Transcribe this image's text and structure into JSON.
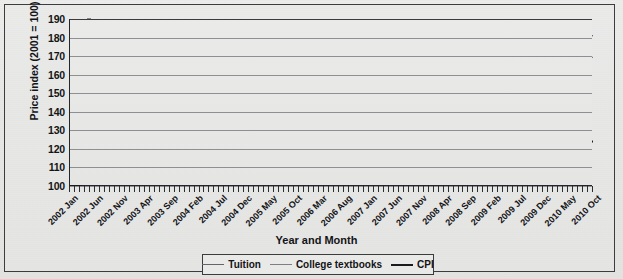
{
  "figure": {
    "background_color": "#e9e9e7",
    "frame_color": "#3b3c3e",
    "axis_color": "#25262a",
    "grid_color": "#8d8f93"
  },
  "chart_data": {
    "type": "line",
    "title": "",
    "xlabel": "Year and Month",
    "ylabel": "Price index (2001 = 100)",
    "ylim": [
      100,
      190
    ],
    "ytick_labels": [
      "100",
      "110",
      "120",
      "130",
      "140",
      "150",
      "160",
      "170",
      "180",
      "190"
    ],
    "ytick_values": [
      100,
      110,
      120,
      130,
      140,
      150,
      160,
      170,
      180,
      190
    ],
    "grid": true,
    "grid_axis": "y",
    "legend_position": "bottom",
    "x_tick_count": 106,
    "x_label_interval": 5,
    "tick_labels": [
      "2002 Jan",
      "2002 Jun",
      "2002 Nov",
      "2003 Apr",
      "2003 Sep",
      "2004 Feb",
      "2004 Jul",
      "2004 Dec",
      "2005 May",
      "2005 Oct",
      "2006 Mar",
      "2006 Aug",
      "2007 Jan",
      "2007 Jun",
      "2007 Nov",
      "2008 Apr",
      "2008 Sep",
      "2009 Feb",
      "2009 Jul",
      "2009 Dec",
      "2010 May",
      "2010 Oct"
    ],
    "x_start": "2002 Jan",
    "x_end": "2010 Oct",
    "series": [
      {
        "name": "Tuition",
        "color": "#63656a",
        "width": 1.3,
        "values": [
          100.0,
          100.5,
          101.1,
          101.6,
          102.2,
          102.7,
          103.3,
          104.5,
          105.8,
          106.4,
          107.0,
          107.5,
          108.1,
          108.7,
          109.4,
          110.0,
          110.6,
          111.3,
          111.9,
          113.6,
          115.4,
          116.1,
          116.8,
          117.5,
          118.2,
          118.9,
          119.6,
          120.3,
          121.0,
          121.7,
          122.4,
          124.4,
          126.4,
          127.2,
          128.0,
          128.8,
          129.5,
          130.3,
          131.1,
          131.9,
          132.7,
          133.5,
          134.3,
          136.1,
          137.9,
          138.6,
          139.3,
          140.0,
          140.8,
          141.5,
          142.2,
          143.0,
          143.7,
          144.5,
          145.2,
          146.8,
          148.4,
          149.0,
          149.6,
          150.3,
          150.9,
          151.6,
          152.2,
          152.9,
          153.5,
          154.2,
          154.8,
          156.3,
          157.8,
          158.4,
          159.0,
          159.6,
          160.2,
          160.8,
          161.5,
          162.1,
          162.7,
          163.4,
          164.0,
          165.4,
          166.8,
          167.3,
          167.9,
          168.5,
          169.1,
          169.7,
          170.3,
          170.9,
          171.5,
          172.1,
          172.8,
          174.1,
          175.4,
          175.9,
          176.4,
          176.9,
          177.4,
          177.9,
          178.4,
          178.8,
          179.2,
          179.6,
          180.0,
          180.4,
          180.7,
          181.0
        ]
      },
      {
        "name": "College textbooks",
        "color": "#7d7f84",
        "width": 1.3,
        "values": [
          100.0,
          100.6,
          101.3,
          101.8,
          102.2,
          102.5,
          102.8,
          104.6,
          106.4,
          106.8,
          107.1,
          107.3,
          107.5,
          107.7,
          107.9,
          108.1,
          108.3,
          108.5,
          108.7,
          111.0,
          113.2,
          113.5,
          113.7,
          113.9,
          114.1,
          114.3,
          114.5,
          114.7,
          114.9,
          115.1,
          115.3,
          117.3,
          119.2,
          119.5,
          119.8,
          120.0,
          120.2,
          120.4,
          120.6,
          120.8,
          121.0,
          121.2,
          121.4,
          123.5,
          125.6,
          125.9,
          126.2,
          126.4,
          126.6,
          126.8,
          127.0,
          127.2,
          127.4,
          127.6,
          127.8,
          130.6,
          133.3,
          133.7,
          134.0,
          134.3,
          134.6,
          134.9,
          135.2,
          135.5,
          135.8,
          136.1,
          136.4,
          138.8,
          141.2,
          141.6,
          142.0,
          142.4,
          142.8,
          143.2,
          143.6,
          144.0,
          144.4,
          144.8,
          145.2,
          148.0,
          150.7,
          151.1,
          151.5,
          151.9,
          152.3,
          152.7,
          153.1,
          153.5,
          153.9,
          154.3,
          154.7,
          157.6,
          160.4,
          160.9,
          161.4,
          161.9,
          162.4,
          162.9,
          163.4,
          163.9,
          164.4,
          166.8,
          169.2,
          169.0,
          169.1,
          169.3
        ]
      },
      {
        "name": "CPI",
        "color": "#1a1b1e",
        "width": 1.9,
        "values": [
          100.0,
          100.3,
          100.7,
          101.1,
          101.3,
          101.4,
          101.5,
          101.6,
          101.9,
          102.1,
          102.2,
          102.2,
          102.5,
          103.2,
          104.0,
          104.0,
          103.8,
          103.9,
          104.1,
          104.2,
          104.5,
          104.7,
          104.8,
          104.6,
          105.0,
          105.6,
          106.1,
          106.6,
          106.9,
          107.1,
          107.3,
          107.5,
          108.1,
          108.4,
          108.4,
          108.3,
          108.5,
          109.1,
          109.8,
          110.4,
          110.7,
          110.8,
          111.0,
          111.4,
          112.5,
          112.8,
          112.6,
          112.4,
          112.8,
          113.2,
          113.7,
          114.3,
          114.6,
          114.9,
          115.1,
          115.2,
          115.3,
          115.2,
          115.0,
          114.9,
          115.3,
          115.9,
          116.6,
          117.0,
          117.2,
          117.3,
          117.5,
          117.7,
          118.0,
          118.4,
          118.7,
          118.8,
          119.1,
          119.8,
          120.6,
          121.3,
          121.8,
          122.2,
          122.7,
          123.3,
          124.0,
          123.7,
          122.6,
          121.2,
          120.8,
          121.0,
          121.2,
          121.0,
          120.9,
          121.2,
          121.8,
          122.3,
          122.5,
          122.6,
          122.7,
          122.6,
          122.6,
          122.7,
          122.8,
          123.0,
          123.2,
          123.4,
          123.5,
          123.7,
          123.8,
          124.0
        ]
      }
    ]
  },
  "legend": {
    "items": [
      {
        "label": "Tuition",
        "color": "#63656a"
      },
      {
        "label": "College textbooks",
        "color": "#7d7f84"
      },
      {
        "label": "CPI",
        "color": "#1a1b1e"
      }
    ]
  }
}
